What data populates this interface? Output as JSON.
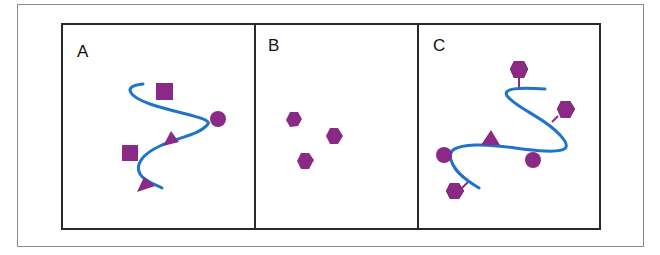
{
  "figure": {
    "colors": {
      "strand": "#1f73c9",
      "glyph": "#8b2a86",
      "frame": "#2a2a2a",
      "outer_border": "#8a8a8a"
    },
    "panels": [
      {
        "label": "A",
        "description": "Wavy strand with attached square, circle and triangle glyphs",
        "glyphs": [
          "square",
          "circle",
          "triangle",
          "square",
          "triangle"
        ]
      },
      {
        "label": "B",
        "description": "Three free hexagons",
        "glyphs": [
          "hexagon",
          "hexagon",
          "hexagon"
        ]
      },
      {
        "label": "C",
        "description": "Wavy strand with hexagons on stalks, circles and a triangle",
        "glyphs": [
          "hexagon",
          "hexagon",
          "triangle",
          "circle",
          "circle",
          "hexagon"
        ]
      }
    ]
  }
}
